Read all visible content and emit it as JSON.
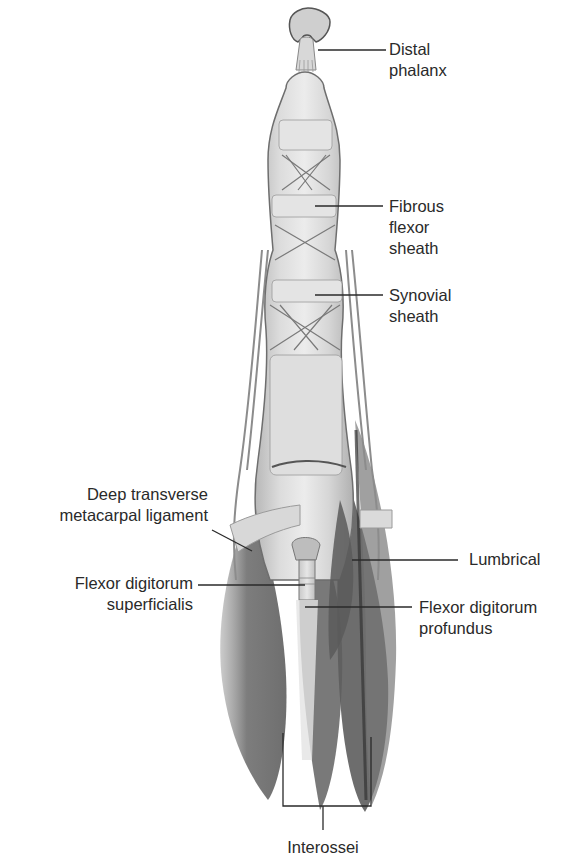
{
  "figure": {
    "colors": {
      "background": "#ffffff",
      "sheath_fill": "#d9d9d9",
      "sheath_outline": "#6e6e6e",
      "muscle_fill": "#6f6f6f",
      "muscle_dark": "#4a4a4a",
      "leader_line": "#2a2a2a",
      "label_text": "#2a2a2a"
    }
  },
  "labels": [
    {
      "id": "distal-phalanx",
      "text": "Distal\nphalanx",
      "side": "right"
    },
    {
      "id": "fibrous-flexor-sheath",
      "text": "Fibrous\nflexor\nsheath",
      "side": "right"
    },
    {
      "id": "synovial-sheath",
      "text": "Synovial\nsheath",
      "side": "right"
    },
    {
      "id": "deep-transverse-metacarpal-ligament",
      "text": "Deep transverse\nmetacarpal ligament",
      "side": "left"
    },
    {
      "id": "lumbrical",
      "text": "Lumbrical",
      "side": "right"
    },
    {
      "id": "flexor-digitorum-superficialis",
      "text": "Flexor digitorum\nsuperficialis",
      "side": "left"
    },
    {
      "id": "flexor-digitorum-profundus",
      "text": "Flexor  digitorum\nprofundus",
      "side": "right"
    },
    {
      "id": "interossei",
      "text": "Interossei",
      "side": "bottom"
    }
  ]
}
